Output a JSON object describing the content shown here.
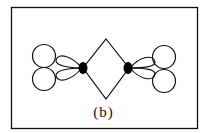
{
  "figure": {
    "label": "(b)"
  },
  "colors": {
    "stroke": "#111111",
    "fill_dot": "#000000",
    "background": "#ffffff"
  }
}
